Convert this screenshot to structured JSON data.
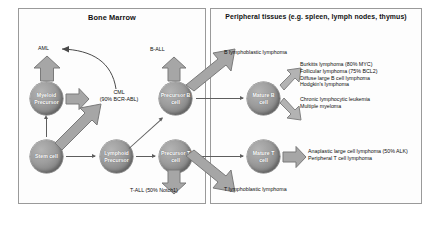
{
  "figure": {
    "panels": {
      "bone_marrow": {
        "title": "Bone Marrow"
      },
      "peripheral": {
        "title": "Peripheral tissues (e.g. spleen, lymph nodes, thymus)"
      }
    },
    "cells": {
      "myeloid_precursor": "Myeloid Precursor",
      "stem_cell": "Stem cell",
      "lymphoid_precursor": "Lymphoid Precursor",
      "precursor_b": "Precursor B cell",
      "precursor_t": "Precursor T cell",
      "mature_b": "Mature B cell",
      "mature_t": "Mature T cell"
    },
    "labels": {
      "aml": "AML",
      "cml": "CML\n(90% BCR-ABL)",
      "cml_line1": "CML",
      "cml_line2": "(90% BCR-ABL)",
      "b_all": "B-ALL",
      "t_all": "T-ALL (50% Notch1)",
      "b_lymphoblastic": "B lymphoblastic lymphoma",
      "t_lymphoblastic": "T lymphoblastic lymphoma"
    },
    "b_cell_diseases_group1": [
      "Burkitts lymphoma (80% MYC)",
      "Follicular lymphoma (75% BCL2)",
      "Diffuse large B cell lymphoma",
      "Hodgkin's lymphoma"
    ],
    "b_cell_diseases_group2": [
      "Chronic lymphocytic leukemia",
      "Multiple myeloma"
    ],
    "t_cell_diseases": [
      "Anaplastic large cell lymphoma (50% ALK)",
      "Peripheral T cell lymphoma"
    ],
    "colors": {
      "cell_fill": "#9d9d9d",
      "block_arrow_fill": "#a6a6a6",
      "thin_arrow": "#5e5e5e",
      "panel_border": "#9a9a9a",
      "text": "#0d0d0d",
      "background": "#ffffff"
    }
  }
}
